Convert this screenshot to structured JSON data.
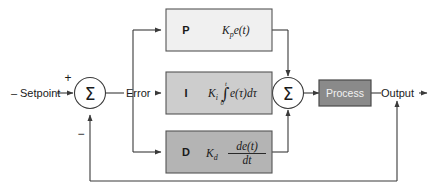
{
  "diagram": {
    "type": "control-block-diagram",
    "colors": {
      "p_block_fill": "#f0f0f0",
      "i_block_fill": "#cdcdcd",
      "d_block_fill": "#b4b4b4",
      "process_fill": "#8a8a8a",
      "block_stroke": "#555555",
      "wire": "#3a3a3a",
      "background": "#ffffff",
      "text": "#1a1a1a",
      "process_text": "#f2f2f2"
    },
    "signals": {
      "setpoint_label": "Setpoint",
      "setpoint_dash": "–",
      "error_label": "Error",
      "output_label": "Output",
      "plus_sign": "+",
      "minus_sign": "−"
    },
    "summing_junctions": [
      {
        "name": "input-summing-junction",
        "symbol": "Σ"
      },
      {
        "name": "controller-summing-junction",
        "symbol": "Σ"
      }
    ],
    "blocks": [
      {
        "id": "proportional",
        "label": "P",
        "gain": "K",
        "gain_sub": "p",
        "term": "e(t)",
        "formula_plain": "Kₚ e(t)"
      },
      {
        "id": "integral",
        "label": "I",
        "gain": "K",
        "gain_sub": "i",
        "integral_symbol": "∫",
        "upper_limit": "t",
        "lower_limit": "0",
        "term": "e(τ)dτ",
        "formula_plain": "Kᵢ ∫₀ᵗ e(τ)dτ"
      },
      {
        "id": "derivative",
        "label": "D",
        "gain": "K",
        "gain_sub": "d",
        "numerator": "de(t)",
        "denominator": "dt",
        "formula_plain": "Kᵈ de(t)/dt"
      },
      {
        "id": "process",
        "label": "Process"
      }
    ]
  }
}
